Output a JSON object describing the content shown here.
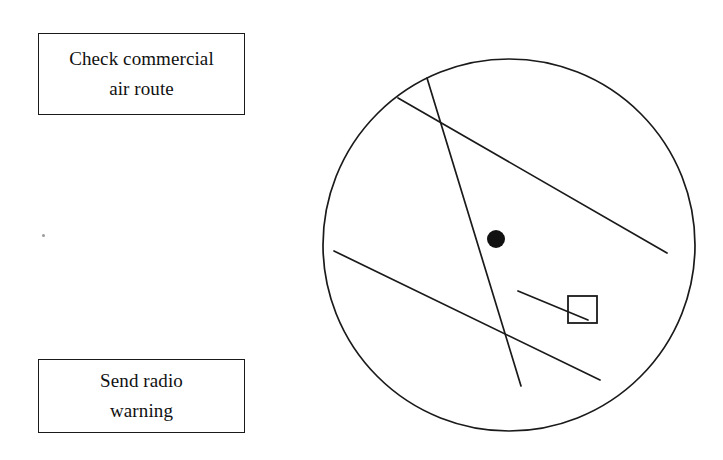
{
  "page": {
    "background_color": "#ffffff",
    "ink_color": "#111111",
    "width": 723,
    "height": 460
  },
  "boxes": [
    {
      "name": "check-commercial-air-route",
      "line1": "Check commercial",
      "line2": "air route",
      "x": 38,
      "y": 33,
      "width": 207,
      "height": 82
    },
    {
      "name": "send-radio-warning",
      "line1": "Send radio",
      "line2": "warning",
      "x": 38,
      "y": 359,
      "width": 207,
      "height": 74
    }
  ],
  "diagram": {
    "name": "radar-scope",
    "circle": {
      "cx": 509,
      "cy": 245,
      "r": 186,
      "stroke": "#1a1a1a",
      "stroke_width": 1.7
    },
    "target_dot": {
      "cx": 496,
      "cy": 239,
      "r": 9,
      "fill": "#111111"
    },
    "target_square": {
      "x": 568,
      "y": 296,
      "width": 29,
      "height": 27,
      "stroke": "#1a1a1a",
      "stroke_width": 1.8
    },
    "tracks": [
      {
        "name": "steep-track",
        "x1": 427,
        "y1": 78,
        "x2": 521,
        "y2": 386
      },
      {
        "name": "upper-diagonal-track",
        "x1": 398,
        "y1": 98,
        "x2": 667,
        "y2": 253
      },
      {
        "name": "lower-diagonal-track",
        "x1": 334,
        "y1": 251,
        "x2": 600,
        "y2": 380
      },
      {
        "name": "short-leader-line",
        "x1": 518,
        "y1": 291,
        "x2": 588,
        "y2": 320
      }
    ]
  },
  "artifacts": {
    "speck_label": "scan-speck"
  }
}
